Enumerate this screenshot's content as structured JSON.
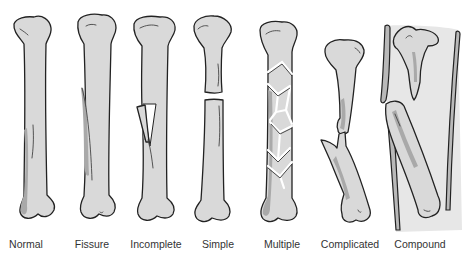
{
  "figure": {
    "colors": {
      "bone_fill": "#d9d9d9",
      "bone_shade": "#a9a9a9",
      "outline": "#222222",
      "label_text": "#333333",
      "background": "#ffffff"
    },
    "panels": [
      {
        "id": "normal",
        "label": "Normal",
        "x": 26
      },
      {
        "id": "fissure",
        "label": "Fissure",
        "x": 92
      },
      {
        "id": "incomplete",
        "label": "Incomplete",
        "x": 156
      },
      {
        "id": "simple",
        "label": "Simple",
        "x": 218
      },
      {
        "id": "multiple",
        "label": "Multiple",
        "x": 282
      },
      {
        "id": "complicated",
        "label": "Complicated",
        "x": 350
      },
      {
        "id": "compound",
        "label": "Compound",
        "x": 420
      }
    ]
  }
}
